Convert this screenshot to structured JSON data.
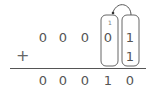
{
  "operation": "binary-addition",
  "operator": "+",
  "addend1": [
    "0",
    "0",
    "0",
    "0",
    "1"
  ],
  "addend2": [
    "",
    "",
    "",
    "",
    "1"
  ],
  "carry": {
    "column": 4,
    "value": "1"
  },
  "result": [
    "0",
    "0",
    "0",
    "1",
    "0"
  ],
  "highlighted_columns": [
    4,
    5
  ],
  "colors": {
    "text": "#555555",
    "line": "#555555",
    "box": "#666666"
  }
}
